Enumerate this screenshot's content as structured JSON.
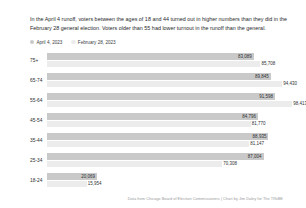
{
  "dek": "In the April 4 runoff, voters between the ages of 18 and 44 turned out in higher numbers than they did in the February 28 general election. Voters older than 55 had lower turnout in the runoff than the general.",
  "legend": {
    "items": [
      {
        "label": "April 4, 2023",
        "color": "#c9c9c9"
      },
      {
        "label": "February 28, 2023",
        "color": "#ececec"
      }
    ]
  },
  "credit": "Data from Chicago Board of Election Commissioners  |  Chart by Jim Daley for The TRiiBE",
  "chart_data": {
    "type": "bar",
    "orientation": "horizontal",
    "title": "",
    "subtitle": "",
    "xlabel": "",
    "ylabel": "",
    "grid": false,
    "legend_position": "top-left",
    "xlim": [
      0,
      100000
    ],
    "categories": [
      "75+",
      "65-74",
      "55-64",
      "45-54",
      "35-44",
      "25-34",
      "18-24"
    ],
    "series": [
      {
        "name": "April 4, 2023",
        "color": "#c9c9c9",
        "values": [
          83089,
          89845,
          91598,
          84796,
          88935,
          87004,
          20069
        ],
        "labels": [
          "83,089",
          "89,845",
          "91,598",
          "84,796",
          "88,935",
          "87,004",
          "20,069"
        ]
      },
      {
        "name": "February 28, 2023",
        "color": "#ececec",
        "values": [
          85708,
          94430,
          98413,
          81770,
          81147,
          70308,
          15954
        ],
        "labels": [
          "85,708",
          "94,430",
          "98,413",
          "81,770",
          "81,147",
          "70,308",
          "15,954"
        ]
      }
    ]
  }
}
